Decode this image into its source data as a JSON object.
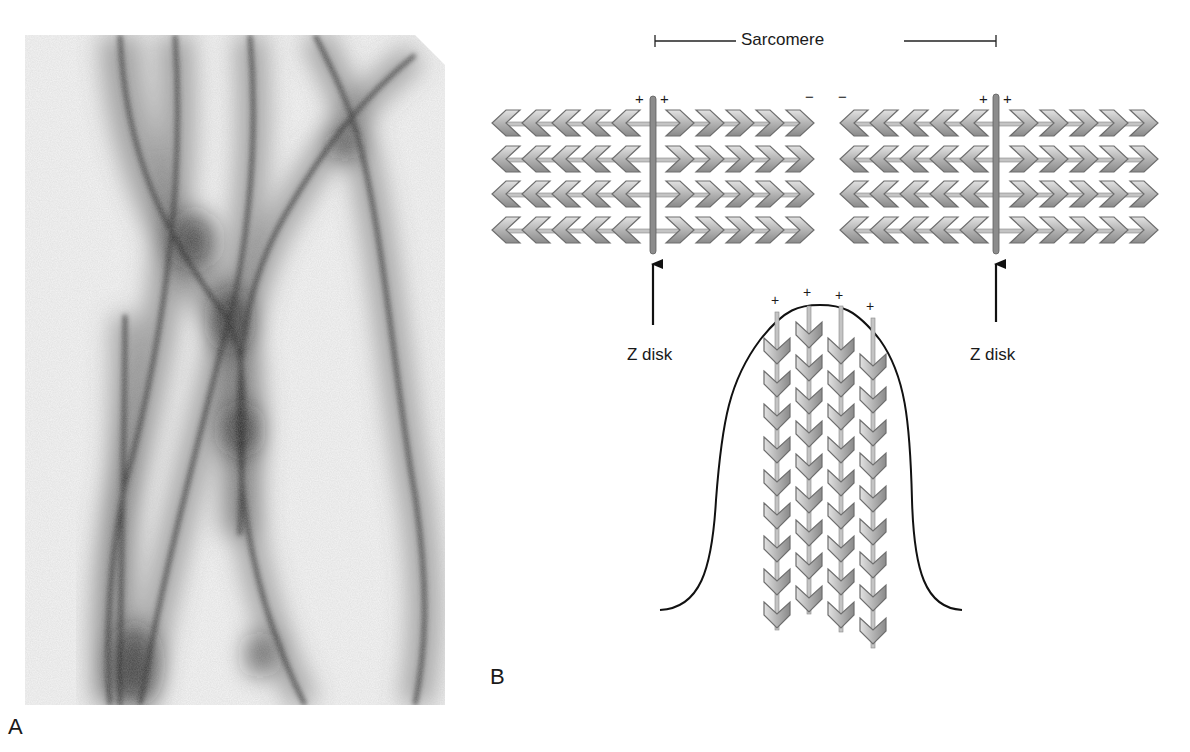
{
  "figure": {
    "panel_a": {
      "label": "A",
      "content": "Electron micrograph of actin filaments (negative stain)"
    },
    "panel_b": {
      "label": "B",
      "sarcomere_label": "Sarcomere",
      "z_disk_labels": [
        "Z disk",
        "Z disk"
      ],
      "polarity_marks": {
        "left_z_disk": [
          "+",
          "+"
        ],
        "middle_gap": [
          "−",
          "−"
        ],
        "right_z_disk": [
          "+",
          "+"
        ],
        "microvillus_tips": [
          "+",
          "+",
          "+",
          "+"
        ]
      },
      "sarcomere_rows_per_block": 4,
      "chevrons_per_half_row": 5,
      "microvillus_filaments": 4
    },
    "colors": {
      "chevron_fill_light": "#d8d8d8",
      "chevron_fill_dark": "#8a8a8a",
      "chevron_stroke": "#6e6e6e",
      "z_disk": "#8c8c8c",
      "line": "#111111"
    }
  }
}
